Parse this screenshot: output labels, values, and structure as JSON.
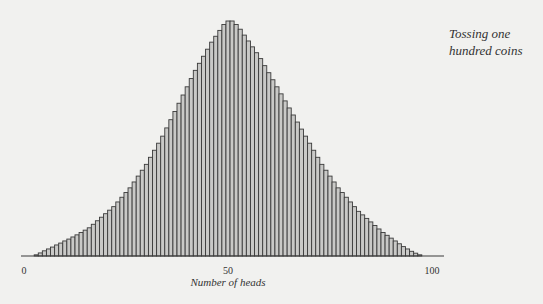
{
  "chart_data": {
    "type": "bar",
    "title": "Tossing one hundred coins",
    "xlabel": "Number of heads",
    "ylabel": "",
    "x_ticks": [
      "0",
      "50",
      "100"
    ],
    "xlim": [
      0,
      100
    ],
    "grid": false,
    "legend": null,
    "value_units": "relative height (% of peak)",
    "categories": [
      0,
      1,
      2,
      3,
      4,
      5,
      6,
      7,
      8,
      9,
      10,
      11,
      12,
      13,
      14,
      15,
      16,
      17,
      18,
      19,
      20,
      21,
      22,
      23,
      24,
      25,
      26,
      27,
      28,
      29,
      30,
      31,
      32,
      33,
      34,
      35,
      36,
      37,
      38,
      39,
      40,
      41,
      42,
      43,
      44,
      45,
      46,
      47,
      48,
      49,
      50,
      51,
      52,
      53,
      54,
      55,
      56,
      57,
      58,
      59,
      60,
      61,
      62,
      63,
      64,
      65,
      66,
      67,
      68,
      69,
      70,
      71,
      72,
      73,
      74,
      75,
      76,
      77,
      78,
      79,
      80,
      81,
      82,
      83,
      84,
      85,
      86,
      87,
      88,
      89,
      90,
      91,
      92,
      93,
      94,
      95,
      96,
      97,
      98,
      99,
      100
    ],
    "values": [
      0,
      0,
      0,
      0.5,
      1.3,
      2.2,
      3,
      3.8,
      4.7,
      5.5,
      6.4,
      7.2,
      8.1,
      9,
      10,
      11,
      12,
      13.5,
      15,
      16.5,
      18,
      19.5,
      21,
      23,
      25,
      27,
      29,
      31.5,
      34,
      36.5,
      39,
      42,
      45,
      48,
      51,
      54.5,
      58,
      61.5,
      65,
      68.5,
      72,
      75.5,
      79,
      82,
      85,
      88,
      91,
      93.5,
      96,
      98.5,
      100,
      100,
      98.5,
      96.5,
      94,
      91.5,
      89,
      86.5,
      84,
      81,
      78,
      75,
      72,
      69,
      66,
      63,
      60,
      57,
      54,
      51,
      48,
      45,
      42,
      39,
      36.5,
      34,
      31.5,
      29,
      27,
      25,
      23,
      21,
      19,
      17.5,
      16,
      14.5,
      13,
      11.5,
      10,
      8.8,
      7.6,
      6.4,
      5.2,
      4,
      3,
      2,
      1.2,
      0.5,
      0,
      0,
      0
    ]
  },
  "annotation": {
    "caption": "Tossing one hundred coins"
  },
  "axis": {
    "tick_0": "0",
    "tick_50": "50",
    "tick_100": "100",
    "xlabel": "Number of heads"
  },
  "colors": {
    "background": "#f1f1ef",
    "bar_fill": "#c9c9c7",
    "bar_stroke": "#3a3a3a",
    "axis": "#3a3a3a",
    "text": "#333333"
  }
}
